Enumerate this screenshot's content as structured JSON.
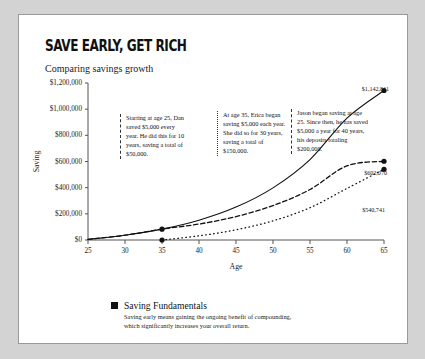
{
  "header": {
    "title": "SAVE EARLY, GET RICH",
    "subtitle": "Comparing savings growth"
  },
  "annotations": [
    {
      "id": "dan",
      "text": "Starting at age 25, Dan saved $5,000 every year. He did this for 10 years, saving a total of $50,000."
    },
    {
      "id": "erica",
      "text": "At age 35, Erica began saving $5,000 each year. She did so for 30 years, saving a total of $150,000."
    },
    {
      "id": "jason",
      "text": "Jason began saving at age 25. Since then, he has saved $5,000 a year for 40 years, his deposits totaling $200,000."
    }
  ],
  "endpoint_labels": {
    "jason": "$1,142,811",
    "dan": "$602,070",
    "erica": "$540,741"
  },
  "footer": {
    "title": "Saving Fundamentals",
    "body": "Saving early means gaining the ongoing benefit of compounding, which significantly increases your overall return."
  },
  "colors": {
    "ink": "#111111",
    "axis": "#555555",
    "card": "#ffffff",
    "page": "#d3d3d3"
  },
  "chart_data": {
    "type": "line",
    "title": "SAVE EARLY, GET RICH",
    "subtitle": "Comparing savings growth",
    "xlabel": "Age",
    "ylabel": "Saving",
    "xlim": [
      25,
      65
    ],
    "ylim": [
      0,
      1200000
    ],
    "xticks": [
      25,
      30,
      35,
      40,
      45,
      50,
      55,
      60,
      65
    ],
    "yticks": [
      0,
      200000,
      400000,
      600000,
      800000,
      1000000,
      1200000
    ],
    "ytick_labels": [
      "$0",
      "$200,000",
      "$400,000",
      "$600,000",
      "$800,000",
      "$1,000,000",
      "$1,200,000"
    ],
    "grid": false,
    "legend": "none",
    "annual_contribution": 5000,
    "growth_rate": 0.08,
    "series": [
      {
        "name": "Jason",
        "style": "solid",
        "start_age": 25,
        "end_age": 65,
        "contribution_years": 40,
        "total_deposits": 200000,
        "final_value": 1142811,
        "x": [
          25,
          30,
          35,
          40,
          45,
          50,
          55,
          60,
          65
        ],
        "values": [
          5000,
          36600,
          83000,
          151200,
          251300,
          398400,
          614500,
          932000,
          1142811
        ]
      },
      {
        "name": "Dan",
        "style": "dashed",
        "start_age": 25,
        "end_age": 65,
        "contribution_years": 10,
        "stop_age": 35,
        "total_deposits": 50000,
        "final_value": 602070,
        "x": [
          25,
          30,
          35,
          40,
          45,
          50,
          55,
          60,
          65
        ],
        "values": [
          5000,
          36600,
          83000,
          122000,
          179000,
          263000,
          386000,
          567000,
          602070
        ]
      },
      {
        "name": "Erica",
        "style": "dotted",
        "start_age": 35,
        "end_age": 65,
        "contribution_years": 30,
        "total_deposits": 150000,
        "final_value": 540741,
        "x": [
          35,
          40,
          45,
          50,
          55,
          60,
          65
        ],
        "values": [
          0,
          31700,
          78200,
          146500,
          246900,
          394300,
          540741
        ]
      }
    ],
    "markers": [
      {
        "age": 35,
        "series": "Dan",
        "value": 83000
      },
      {
        "age": 35,
        "series": "Erica",
        "value": 0
      },
      {
        "age": 65,
        "series": "Jason",
        "value": 1142811
      },
      {
        "age": 65,
        "series": "Dan",
        "value": 602070
      },
      {
        "age": 65,
        "series": "Erica",
        "value": 540741
      }
    ]
  }
}
